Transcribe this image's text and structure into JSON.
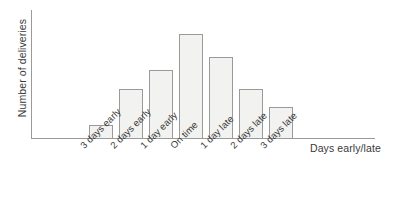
{
  "chart_data": {
    "type": "bar",
    "title": "",
    "xlabel": "Days early/late",
    "ylabel": "Number of deliveries",
    "categories": [
      "3 days early",
      "2 days early",
      "1 day early",
      "On time",
      "1 day late",
      "2 days late",
      "3 days late"
    ],
    "values": [
      14,
      50,
      69,
      105,
      82,
      50,
      32
    ],
    "ylim": [
      0,
      129
    ],
    "grid": false,
    "legend": "none",
    "axis_ticks_shown": false,
    "bar_fill_color": "#f2f2f0",
    "bar_border_color": "#9a9a9a",
    "axis_color": "#9a9a9a",
    "background_color": "#ffffff",
    "text_color": "#3a3a3a",
    "tick_label_rotation_deg": -45
  }
}
